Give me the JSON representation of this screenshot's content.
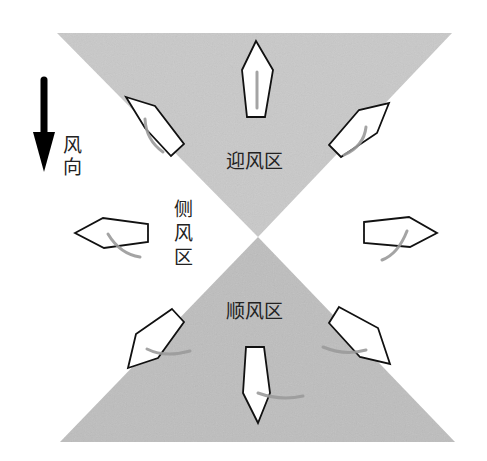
{
  "diagram": {
    "wind_direction": {
      "label": "风向",
      "chars": [
        "风",
        "向"
      ],
      "icon": "arrow-down-icon",
      "direction": "down"
    },
    "zones": {
      "upwind": {
        "label": "迎风区",
        "color": "#c8c8c8",
        "shape": "inverted-triangle",
        "points": [
          [
            57,
            33
          ],
          [
            452,
            33
          ],
          [
            258,
            237
          ]
        ]
      },
      "downwind": {
        "label": "顺风区",
        "color": "#bdbdbd",
        "shape": "triangle",
        "points": [
          [
            258,
            237
          ],
          [
            455,
            442
          ],
          [
            60,
            442
          ]
        ]
      },
      "crosswind": {
        "label": "侧风区",
        "chars": [
          "侧",
          "风",
          "区"
        ]
      }
    },
    "boats": [
      {
        "name": "boat-top",
        "heading": "up",
        "zone": "upwind"
      },
      {
        "name": "boat-upper-left",
        "heading": "up-left",
        "zone": "upwind"
      },
      {
        "name": "boat-upper-right",
        "heading": "up-right",
        "zone": "upwind"
      },
      {
        "name": "boat-left",
        "heading": "left",
        "zone": "crosswind"
      },
      {
        "name": "boat-right",
        "heading": "right",
        "zone": "crosswind"
      },
      {
        "name": "boat-lower-left",
        "heading": "down-left",
        "zone": "downwind"
      },
      {
        "name": "boat-lower-right",
        "heading": "down-right",
        "zone": "downwind"
      },
      {
        "name": "boat-bottom",
        "heading": "down",
        "zone": "downwind"
      }
    ],
    "colors": {
      "background": "#ffffff",
      "hull_fill": "#ffffff",
      "hull_stroke": "#111111",
      "sail": "#9a9a9a",
      "arrow": "#000000",
      "text": "#222222"
    }
  }
}
